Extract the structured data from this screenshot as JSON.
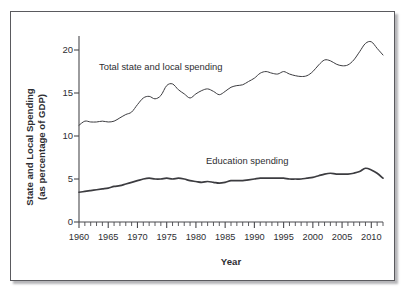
{
  "figure": {
    "xlabel": "Year",
    "ylabel_line1": "State and Local Spending",
    "ylabel_line2": "(as percentage of GDP)",
    "annotation_total": "Total state and local spending",
    "annotation_education": "Education spending",
    "line_color": "#3c3c40",
    "frame_color": "#5a5a5e",
    "background": "#ffffff"
  },
  "axes": {
    "y_ticks": [
      "0",
      "5",
      "10",
      "15",
      "20"
    ],
    "x_ticks": [
      "1960",
      "1965",
      "1970",
      "1975",
      "1980",
      "1985",
      "1990",
      "1995",
      "2000",
      "2005",
      "2010"
    ]
  },
  "chart_data": {
    "type": "line",
    "title": "",
    "xlabel": "Year",
    "ylabel": "State and Local Spending (as percentage of GDP)",
    "xlim": [
      1960,
      2012
    ],
    "ylim": [
      0,
      22.5
    ],
    "grid": false,
    "legend": "inline-annotations",
    "y_ticks": [
      0,
      5,
      10,
      15,
      20
    ],
    "x_ticks": [
      1960,
      1965,
      1970,
      1975,
      1980,
      1985,
      1990,
      1995,
      2000,
      2005,
      2010
    ],
    "x_minor_tick_interval": 1,
    "x": [
      1960,
      1961,
      1962,
      1963,
      1964,
      1965,
      1966,
      1967,
      1968,
      1969,
      1970,
      1971,
      1972,
      1973,
      1974,
      1975,
      1976,
      1977,
      1978,
      1979,
      1980,
      1981,
      1982,
      1983,
      1984,
      1985,
      1986,
      1987,
      1988,
      1989,
      1990,
      1991,
      1992,
      1993,
      1994,
      1995,
      1996,
      1997,
      1998,
      1999,
      2000,
      2001,
      2002,
      2003,
      2004,
      2005,
      2006,
      2007,
      2008,
      2009,
      2010,
      2011,
      2012
    ],
    "series": [
      {
        "name": "Total state and local spending",
        "annotation": "Total state and local spending",
        "values": [
          11.7,
          12.2,
          12.1,
          12.1,
          12.2,
          12.1,
          12.2,
          12.6,
          13.0,
          13.3,
          14.2,
          15.0,
          15.2,
          14.9,
          15.3,
          16.5,
          16.7,
          16.0,
          15.5,
          15.0,
          15.5,
          15.9,
          16.1,
          15.8,
          15.4,
          15.8,
          16.3,
          16.5,
          16.6,
          17.0,
          17.4,
          18.0,
          18.2,
          18.0,
          17.9,
          18.2,
          17.9,
          17.7,
          17.6,
          17.7,
          18.2,
          19.0,
          19.6,
          19.5,
          19.1,
          18.9,
          19.0,
          19.6,
          20.6,
          21.6,
          21.8,
          21.0,
          20.2
        ]
      },
      {
        "name": "Education spending",
        "annotation": "Education spending",
        "values": [
          3.6,
          3.7,
          3.8,
          3.9,
          4.0,
          4.1,
          4.3,
          4.4,
          4.6,
          4.8,
          5.0,
          5.2,
          5.3,
          5.2,
          5.2,
          5.3,
          5.2,
          5.3,
          5.2,
          5.0,
          4.9,
          4.8,
          4.9,
          4.8,
          4.7,
          4.8,
          5.0,
          5.0,
          5.0,
          5.1,
          5.2,
          5.3,
          5.3,
          5.3,
          5.3,
          5.3,
          5.2,
          5.2,
          5.2,
          5.3,
          5.4,
          5.6,
          5.8,
          5.9,
          5.8,
          5.8,
          5.8,
          5.9,
          6.1,
          6.5,
          6.3,
          5.9,
          5.3
        ]
      }
    ]
  }
}
